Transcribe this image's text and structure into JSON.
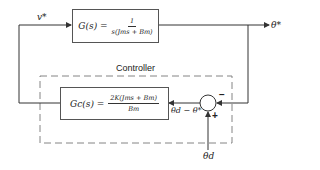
{
  "diagram": {
    "type": "block-diagram",
    "plant": {
      "lhs": "G(s) =",
      "numerator": "1",
      "denominator": "s(Jms + Bm)"
    },
    "controller_group": {
      "label": "Controller",
      "block": {
        "lhs": "Gc(s) =",
        "numerator": "2K(Jms + Bm)",
        "denominator": "Bm"
      }
    },
    "signals": {
      "plant_input": "v*",
      "plant_output": "θ*",
      "error": "θd − θ*",
      "reference": "θd"
    },
    "summing_junction": {
      "feedback_sign": "−",
      "reference_sign": "+"
    },
    "colors": {
      "line": "#333333",
      "dashed_border": "#777777",
      "background": "#ffffff"
    }
  }
}
